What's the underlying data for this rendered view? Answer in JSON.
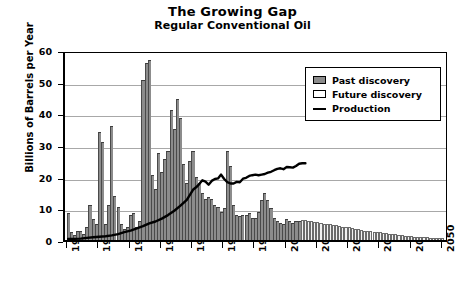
{
  "chart_data": {
    "type": "bar",
    "title": "The Growing Gap",
    "subtitle": "Regular Conventional Oil",
    "xlabel": "",
    "ylabel": "Billions of Barrels per Year",
    "xlim": [
      1929,
      2052
    ],
    "ylim": [
      0,
      60
    ],
    "yticks": [
      0,
      10,
      20,
      30,
      40,
      50,
      60
    ],
    "xticks": [
      1930,
      1940,
      1950,
      1960,
      1970,
      1980,
      1990,
      2000,
      2010,
      2020,
      2030,
      2040,
      2050
    ],
    "grid": "horizontal",
    "legend_position": "top-right",
    "legend": [
      {
        "label": "Past discovery",
        "type": "bar",
        "color": "#8c8c8c"
      },
      {
        "label": "Future discovery",
        "type": "bar",
        "color": "#ffffff"
      },
      {
        "label": "Production",
        "type": "line",
        "color": "#000000"
      }
    ],
    "series": [
      {
        "name": "Past discovery",
        "type": "bar",
        "color": "#8c8c8c",
        "x": [
          1930,
          1931,
          1932,
          1933,
          1934,
          1935,
          1936,
          1937,
          1938,
          1939,
          1940,
          1941,
          1942,
          1943,
          1944,
          1945,
          1946,
          1947,
          1948,
          1949,
          1950,
          1951,
          1952,
          1953,
          1954,
          1955,
          1956,
          1957,
          1958,
          1959,
          1960,
          1961,
          1962,
          1963,
          1964,
          1965,
          1966,
          1967,
          1968,
          1969,
          1970,
          1971,
          1972,
          1973,
          1974,
          1975,
          1976,
          1977,
          1978,
          1979,
          1980,
          1981,
          1982,
          1983,
          1984,
          1985,
          1986,
          1987,
          1988,
          1989,
          1990,
          1991,
          1992,
          1993,
          1994,
          1995,
          1996,
          1997,
          1998,
          1999,
          2000,
          2001,
          2002,
          2003,
          2004
        ],
        "values": [
          8.5,
          2.5,
          1.5,
          3.0,
          3.0,
          2.0,
          4.0,
          11.0,
          6.5,
          5.0,
          34.0,
          31.0,
          5.0,
          11.0,
          36.0,
          14.0,
          10.5,
          5.0,
          3.5,
          4.0,
          8.0,
          8.5,
          4.0,
          6.0,
          50.5,
          56.0,
          57.0,
          20.5,
          16.0,
          27.5,
          21.5,
          25.5,
          28.0,
          41.0,
          35.0,
          44.5,
          38.5,
          24.0,
          18.0,
          25.0,
          28.0,
          20.0,
          18.0,
          15.0,
          13.0,
          13.5,
          13.0,
          11.0,
          10.5,
          9.0,
          10.0,
          28.0,
          23.5,
          11.0,
          8.0,
          7.5,
          8.0,
          8.0,
          8.5,
          7.0,
          7.0,
          9.0,
          12.5,
          15.0,
          12.5,
          10.0,
          7.0,
          6.0,
          5.5,
          5.0,
          6.5,
          6.0,
          5.5,
          6.0,
          6.0
        ]
      },
      {
        "name": "Future discovery",
        "type": "bar",
        "color": "#ffffff",
        "x": [
          2005,
          2006,
          2007,
          2008,
          2009,
          2010,
          2011,
          2012,
          2013,
          2014,
          2015,
          2016,
          2017,
          2018,
          2019,
          2020,
          2021,
          2022,
          2023,
          2024,
          2025,
          2026,
          2027,
          2028,
          2029,
          2030,
          2031,
          2032,
          2033,
          2034,
          2035,
          2036,
          2037,
          2038,
          2039,
          2040,
          2041,
          2042,
          2043,
          2044,
          2045,
          2046,
          2047,
          2048,
          2049,
          2050
        ],
        "values": [
          6.2,
          6.2,
          6.0,
          6.0,
          5.8,
          5.6,
          5.4,
          5.2,
          5.0,
          5.0,
          4.8,
          4.6,
          4.4,
          4.2,
          4.0,
          4.0,
          3.8,
          3.6,
          3.4,
          3.2,
          3.0,
          2.9,
          2.8,
          2.6,
          2.5,
          2.4,
          2.2,
          2.1,
          2.0,
          1.9,
          1.8,
          1.6,
          1.5,
          1.4,
          1.3,
          1.2,
          1.1,
          1.0,
          0.9,
          0.8,
          0.8,
          0.7,
          0.6,
          0.6,
          0.5,
          0.5
        ]
      },
      {
        "name": "Production",
        "type": "line",
        "color": "#000000",
        "x": [
          1930,
          1932,
          1934,
          1936,
          1938,
          1940,
          1942,
          1944,
          1946,
          1948,
          1950,
          1952,
          1954,
          1956,
          1958,
          1960,
          1962,
          1964,
          1966,
          1968,
          1970,
          1971,
          1972,
          1973,
          1974,
          1975,
          1976,
          1977,
          1978,
          1979,
          1980,
          1981,
          1982,
          1983,
          1984,
          1985,
          1986,
          1987,
          1988,
          1989,
          1990,
          1991,
          1992,
          1993,
          1994,
          1995,
          1996,
          1997,
          1998,
          1999,
          2000,
          2001,
          2002,
          2003,
          2004,
          2005,
          2006
        ],
        "values": [
          1.3,
          1.3,
          1.4,
          1.6,
          1.8,
          2.0,
          2.1,
          2.4,
          2.8,
          3.4,
          3.9,
          4.6,
          5.3,
          6.2,
          6.8,
          7.7,
          8.8,
          10.2,
          11.8,
          13.6,
          16.8,
          17.6,
          18.6,
          19.8,
          19.4,
          18.4,
          19.6,
          20.2,
          20.4,
          21.6,
          20.2,
          19.2,
          18.8,
          18.8,
          19.3,
          19.2,
          20.3,
          20.6,
          21.2,
          21.4,
          21.6,
          21.4,
          21.6,
          21.8,
          22.2,
          22.5,
          23.0,
          23.4,
          23.6,
          23.3,
          24.0,
          23.9,
          23.8,
          24.3,
          25.0,
          25.2,
          25.2
        ]
      }
    ]
  }
}
